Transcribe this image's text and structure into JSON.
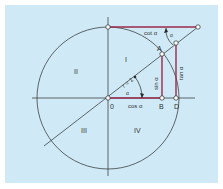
{
  "diagram": {
    "colors": {
      "background": "#cfeaf6",
      "line": "#2a2a2a",
      "highlight": "#9b2a4a",
      "point_fill": "#ffffff"
    },
    "quadrants": [
      "I",
      "II",
      "III",
      "IV"
    ],
    "points": {
      "origin": "0",
      "A": "A",
      "B": "B",
      "D": "D"
    },
    "labels": {
      "radius": "r = 1",
      "alpha_center": "α",
      "alpha_top": "α",
      "sin": "sin α",
      "cos": "cos α",
      "tan": "tan α",
      "cot": "cot α"
    }
  }
}
